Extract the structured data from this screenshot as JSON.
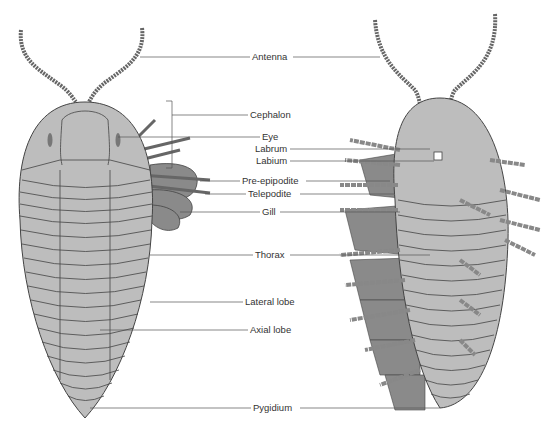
{
  "diagram": {
    "views": [
      "dorsal",
      "ventral"
    ],
    "colors": {
      "body": "#bdbdbd",
      "outline": "#444444",
      "gill": "#8a8a8a",
      "line": "#555555"
    },
    "labels": [
      {
        "id": "antenna",
        "text": "Antenna",
        "x": 252,
        "y": 52
      },
      {
        "id": "cephalon",
        "text": "Cephalon",
        "x": 250,
        "y": 110
      },
      {
        "id": "eye",
        "text": "Eye",
        "x": 262,
        "y": 132
      },
      {
        "id": "labrum",
        "text": "Labrum",
        "x": 255,
        "y": 144
      },
      {
        "id": "labium",
        "text": "Labium",
        "x": 256,
        "y": 156
      },
      {
        "id": "pre-epipodite",
        "text": "Pre-epipodite",
        "x": 242,
        "y": 176
      },
      {
        "id": "telepodite",
        "text": "Telepodite",
        "x": 248,
        "y": 189
      },
      {
        "id": "gill",
        "text": "Gill",
        "x": 262,
        "y": 207
      },
      {
        "id": "thorax",
        "text": "Thorax",
        "x": 255,
        "y": 250
      },
      {
        "id": "lateral-lobe",
        "text": "Lateral lobe",
        "x": 245,
        "y": 297
      },
      {
        "id": "axial-lobe",
        "text": "Axial lobe",
        "x": 250,
        "y": 325
      },
      {
        "id": "pygidium",
        "text": "Pygidium",
        "x": 253,
        "y": 402
      }
    ]
  }
}
